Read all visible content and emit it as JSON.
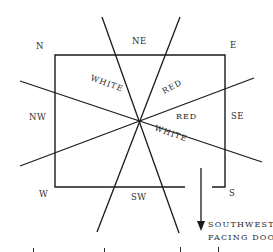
{
  "diagram": {
    "directions": {
      "n": "N",
      "ne": "NE",
      "e": "E",
      "nw": "NW",
      "se": "SE",
      "w": "W",
      "sw": "SW",
      "s": "S"
    },
    "zones": {
      "white_upper": "WHITE",
      "red_upper": "RED",
      "red_right": "RED",
      "white_lower": "WHITE"
    },
    "door_caption": {
      "line1": "SOUTHWEST-",
      "line2": "FACING DOOR"
    },
    "colors": {
      "ink": "#1a1a1a",
      "background": "#ffffff"
    }
  }
}
